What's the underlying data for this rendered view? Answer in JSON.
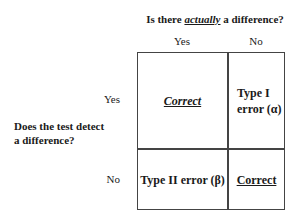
{
  "header": {
    "question_prefix": "Is there ",
    "question_emphasis": "actually",
    "question_suffix": " a difference?"
  },
  "columns": [
    {
      "label": "Yes"
    },
    {
      "label": "No"
    }
  ],
  "side_question": {
    "line1": "Does the test detect",
    "line2": "a difference?"
  },
  "rows": [
    {
      "label": "Yes",
      "cells": [
        {
          "text": "Correct",
          "style": "bold-italic-underline"
        },
        {
          "line1": "Type I",
          "line2": "error (α)",
          "style": "bold"
        }
      ]
    },
    {
      "label": "No",
      "cells": [
        {
          "text": "Type II error (β)",
          "style": "bold"
        },
        {
          "text": "Correct",
          "style": "bold-underline"
        }
      ]
    }
  ],
  "colors": {
    "border": "#444444",
    "text": "#1a1a1a",
    "background": "#ffffff"
  }
}
